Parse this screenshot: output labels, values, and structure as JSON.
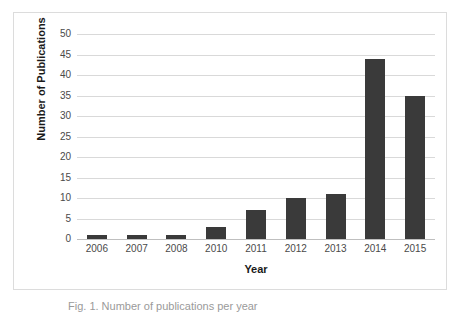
{
  "chart_data": {
    "type": "bar",
    "title": "",
    "categories": [
      "2006",
      "2007",
      "2008",
      "2010",
      "2011",
      "2012",
      "2013",
      "2014",
      "2015"
    ],
    "values": [
      1,
      1,
      1,
      3,
      7,
      10,
      11,
      44,
      35
    ],
    "xlabel": "Year",
    "ylabel": "Number of Publications",
    "ylim": [
      0,
      50
    ],
    "yticks": [
      0,
      5,
      10,
      15,
      20,
      25,
      30,
      35,
      40,
      45,
      50
    ],
    "ytick_labels": [
      "0",
      "5",
      "10",
      "15",
      "20",
      "25",
      "30",
      "35",
      "40",
      "45",
      "50"
    ],
    "grid": true,
    "legend": false,
    "bar_color": "#3a3a3a",
    "gridline_color": "#d9d9d9",
    "plot_background": "#ffffff",
    "border_color": "#dcdcdc"
  },
  "caption": {
    "text": "Fig. 1. Number of publications per year"
  }
}
